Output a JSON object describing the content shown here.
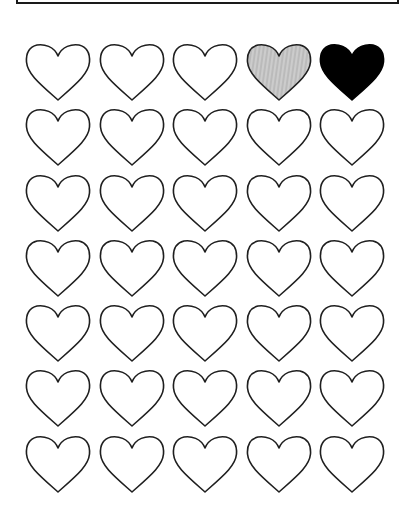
{
  "worksheet": {
    "rows": 7,
    "columns": 5,
    "hearts": [
      [
        "empty",
        "empty",
        "empty",
        "shaded",
        "filled"
      ],
      [
        "empty",
        "empty",
        "empty",
        "empty",
        "empty"
      ],
      [
        "empty",
        "empty",
        "empty",
        "empty",
        "empty"
      ],
      [
        "empty",
        "empty",
        "empty",
        "empty",
        "empty"
      ],
      [
        "empty",
        "empty",
        "empty",
        "empty",
        "empty"
      ],
      [
        "empty",
        "empty",
        "empty",
        "empty",
        "empty"
      ],
      [
        "empty",
        "empty",
        "empty",
        "empty",
        "empty"
      ]
    ],
    "colors": {
      "outline": "#1f1f1f",
      "shaded": "#bdbdbd",
      "filled": "#000000"
    }
  }
}
